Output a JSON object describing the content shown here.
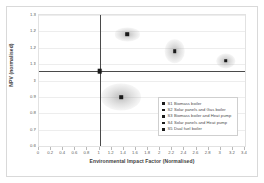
{
  "chart_data": {
    "type": "scatter",
    "title": "",
    "xlabel": "Environmental Impact Factor (Normalised)",
    "ylabel": "NPV (normalised)",
    "xlim": [
      0,
      3.4
    ],
    "ylim": [
      0.6,
      1.3
    ],
    "xticks": [
      "0",
      "0.2",
      "0.4",
      "0.6",
      "0.8",
      "1",
      "1.2",
      "1.4",
      "1.6",
      "1.8",
      "2",
      "2.2",
      "2.4",
      "2.6",
      "2.8",
      "3",
      "3.2",
      "3.4"
    ],
    "yticks": [
      "1.3",
      "1.2",
      "1.2",
      "1.1",
      "1",
      "0.9",
      "0.8",
      "0.7",
      "0.6"
    ],
    "grid": true,
    "legend_position": "lower-right",
    "reference_lines": {
      "x": 1,
      "y": 1
    },
    "series": [
      {
        "name": "S1 Biomass boiler",
        "x": 1.0,
        "y": 1.0,
        "cloud_rx": 0.06,
        "cloud_ry": 0.012,
        "marker": "big"
      },
      {
        "name": "S2 Solar panels and Gas boiler",
        "x": 1.36,
        "y": 0.862,
        "cloud_rx": 0.33,
        "cloud_ry": 0.072,
        "marker": "small"
      },
      {
        "name": "S3 Biomass boiler and Heat pump",
        "x": 1.46,
        "y": 1.196,
        "cloud_rx": 0.2,
        "cloud_ry": 0.035,
        "marker": "small"
      },
      {
        "name": "S4 Solar panels and Heat pump",
        "x": 2.24,
        "y": 1.105,
        "cloud_rx": 0.17,
        "cloud_ry": 0.063,
        "marker": "small"
      },
      {
        "name": "S5 Dual fuel boiler",
        "x": 3.08,
        "y": 1.055,
        "cloud_rx": 0.16,
        "cloud_ry": 0.04,
        "marker": "small"
      }
    ],
    "legend_entries": [
      "S1 Biomass boiler",
      "S2 Solar panels and Gas boiler",
      "S3 Biomass boiler and Heat pump",
      "S4 Solar panels and Heat pump",
      "S5 Dual fuel boiler"
    ],
    "colors": {
      "marker": "#1b1b1b",
      "cloud": "#9a9a9a",
      "axis": "#4a4a4a",
      "grid": "#ededed",
      "frame": "#d9d9d9"
    }
  }
}
